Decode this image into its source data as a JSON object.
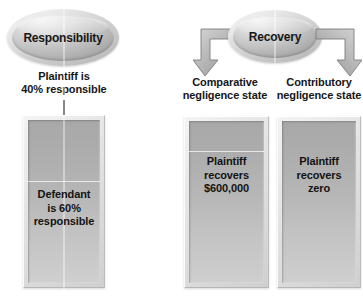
{
  "diagram": {
    "background_color": "#ffffff",
    "text_color": "#131313"
  },
  "left_group": {
    "oval": {
      "label": "Responsibility",
      "fill_color": "#b0b0b0"
    },
    "caption": "Plaintiff is\n40% responsible",
    "caption_line1": "Plaintiff is",
    "caption_line2": "40% responsible",
    "connector": "vertical-line",
    "box": {
      "label_line1": "Defendant",
      "label_line2": "is 60%",
      "label_line3": "responsible",
      "fill_color": "#b6b6b6"
    }
  },
  "right_group": {
    "oval": {
      "label": "Recovery",
      "fill_color": "#b0b0b0"
    },
    "branches": [
      {
        "arrow": "elbow-arrow-down-left",
        "caption_line1": "Comparative",
        "caption_line2": "negligence state",
        "box": {
          "label_line1": "Plaintiff",
          "label_line2": "recovers",
          "label_line3": "$600,000",
          "fill_color": "#b6b6b6"
        }
      },
      {
        "arrow": "elbow-arrow-down-right",
        "caption_line1": "Contributory",
        "caption_line2": "negligence state",
        "box": {
          "label_line1": "Plaintiff",
          "label_line2": "recovers",
          "label_line3": "zero",
          "fill_color": "#b6b6b6"
        }
      }
    ]
  }
}
